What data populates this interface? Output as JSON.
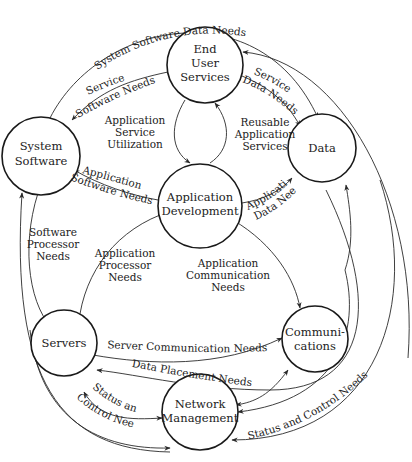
{
  "nodes": {
    "end_user_services": [
      "End",
      "User",
      "Services"
    ],
    "system_software": [
      "System",
      "Software"
    ],
    "data": [
      "Data"
    ],
    "application_development": [
      "Application",
      "Development"
    ],
    "servers": [
      "Servers"
    ],
    "communications": [
      "Communi-",
      "cations"
    ],
    "network_management": [
      "Network",
      "Management"
    ]
  },
  "edges": {
    "system_software_data_needs": "System Software Data Needs",
    "service_software_needs": [
      "Service",
      "Software Needs"
    ],
    "service_data_needs": [
      "Service",
      "Data Needs"
    ],
    "application_service_utilization": [
      "Application",
      "Service",
      "Utilization"
    ],
    "reusable_application_services": [
      "Reusable",
      "Application",
      "Services"
    ],
    "application_software_needs": [
      "Application",
      "Software Needs"
    ],
    "application_data_needs": [
      "Application",
      "Data Needs"
    ],
    "software_processor_needs": [
      "Software",
      "Processor",
      "Needs"
    ],
    "application_processor_needs": [
      "Application",
      "Processor",
      "Needs"
    ],
    "application_communication_needs": [
      "Application",
      "Communication",
      "Needs"
    ],
    "server_communication_needs": "Server Communication Needs",
    "data_placement_needs": "Data Placement Needs",
    "status_and_control_needs_left": [
      "Status and",
      "Control Needs"
    ],
    "status_and_control_needs_right": "Status and Control Needs"
  },
  "colors": {
    "stroke": "#1a1a1a",
    "text": "#222222",
    "background": "#ffffff"
  }
}
